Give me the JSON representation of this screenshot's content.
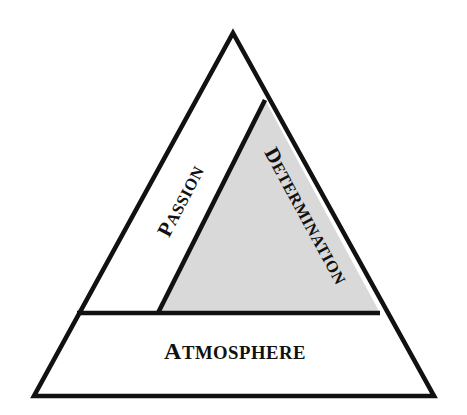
{
  "diagram": {
    "type": "pyramid",
    "title": "",
    "background_color": "#ffffff",
    "stroke_color": "#111111",
    "stroke_width": 4.5,
    "geometry": {
      "apex": [
        233,
        33
      ],
      "bottom_left": [
        34,
        396
      ],
      "bottom_right": [
        434,
        396
      ],
      "divider_y": 313,
      "divider_left_x": 77,
      "divider_right_x": 380,
      "interior_line_top": [
        265,
        100
      ],
      "interior_line_bottom": [
        158,
        313
      ]
    },
    "segments": [
      {
        "id": "passion",
        "label": "PASSION",
        "label_first": "P",
        "label_rest": "ASSION",
        "fill": "#ffffff",
        "rotation_deg": -62.5,
        "position": "upper-left"
      },
      {
        "id": "determination",
        "label": "DETERMINATION",
        "label_first": "D",
        "label_rest": "ETERMINATION",
        "fill": "#d9d9d9",
        "rotation_deg": 61.5,
        "position": "upper-right"
      },
      {
        "id": "atmosphere",
        "label": "ATMOSPHERE",
        "label_first": "A",
        "label_rest": "TMOSPHERE",
        "fill": "#ffffff",
        "rotation_deg": 0,
        "position": "base"
      }
    ]
  }
}
